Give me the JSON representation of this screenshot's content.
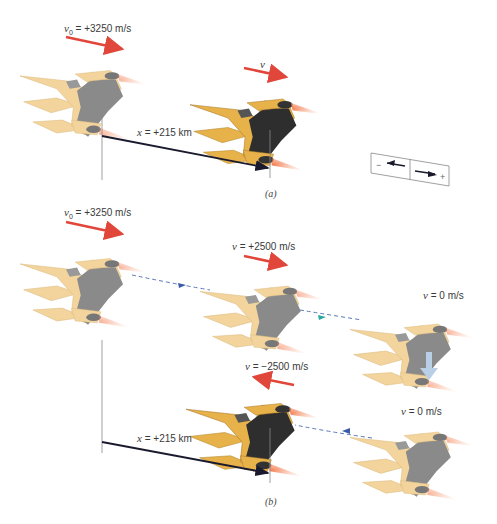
{
  "colors": {
    "velocity_arrow": "#e0463a",
    "displacement_arrow": "#1a1a2e",
    "dashed_path": "#5a78b8",
    "ship_gold": "#e8b24a",
    "ship_gold_faded": "#f2d49c",
    "ship_dark": "#2e2e2e",
    "ship_grey_faded": "#8a8a8a",
    "exhaust": "#f08a5a",
    "down_arrow": "#b8cfe6"
  },
  "panel_a": {
    "caption": "(a)",
    "initial_velocity": {
      "symbol": "v",
      "subscript": "0",
      "text": " = +3250 m/s"
    },
    "final_velocity": {
      "symbol": "v",
      "text": ""
    },
    "displacement": {
      "symbol": "x",
      "text": " = +215 km"
    },
    "direction_legend": {
      "minus": "−",
      "plus": "+"
    }
  },
  "panel_b": {
    "caption": "(b)",
    "initial_velocity": {
      "symbol": "v",
      "subscript": "0",
      "text": " = +3250 m/s"
    },
    "state_2_velocity": {
      "symbol": "v",
      "text": " = +2500 m/s"
    },
    "state_3_velocity": {
      "symbol": "v",
      "text": " = 0 m/s"
    },
    "state_4_velocity": {
      "symbol": "v",
      "text": " = 0 m/s"
    },
    "state_5_velocity": {
      "symbol": "v",
      "text": " = −2500 m/s"
    },
    "displacement": {
      "symbol": "x",
      "text": " = +215 km"
    }
  }
}
